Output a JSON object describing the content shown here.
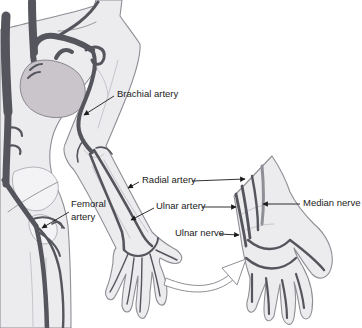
{
  "labels": {
    "brachial_artery": "Brachial artery",
    "radial_artery": "Radial artery",
    "ulnar_artery": "Ulnar artery",
    "ulnar_nerve": "Ulnar nerve",
    "median_nerve": "Median nerve",
    "femoral_artery": "Femoral artery"
  },
  "colors": {
    "background": "#ffffff",
    "body_fill": "#ecebee",
    "body_outline": "#8e8e95",
    "artery": "#55555d",
    "nerve": "#8f8f97",
    "heart_fill": "#c9c5cb",
    "bone_fill": "#f3f2f5",
    "bone_outline": "#b3b2ba",
    "detail_line": "#c6c5cc",
    "label_text": "#1b1b1b",
    "pointer": "#1b1b1b"
  }
}
